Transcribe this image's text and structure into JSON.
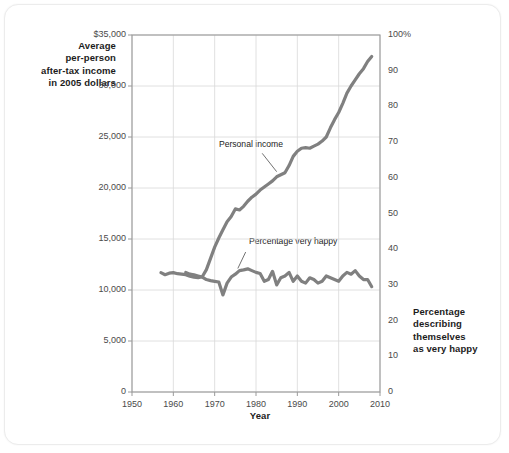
{
  "chart_data": {
    "type": "line",
    "title": "",
    "xlabel": "Year",
    "ylabel": "Average per-person after-tax income in 2005 dollars",
    "y2label": "Percentage describing themselves as very happy",
    "xlim": [
      1950,
      2010
    ],
    "ylim": [
      0,
      35000
    ],
    "y2lim": [
      0,
      100
    ],
    "grid": true,
    "legend_position": "inline-annotations",
    "xticks": [
      1950,
      1960,
      1970,
      1980,
      1990,
      2000,
      2010
    ],
    "xtick_labels": [
      "1950",
      "1960",
      "1970",
      "1980",
      "1990",
      "2000",
      "2010"
    ],
    "yticks": [
      0,
      5000,
      10000,
      15000,
      20000,
      25000,
      30000,
      35000
    ],
    "ytick_labels": [
      "0",
      "5,000",
      "10,000",
      "15,000",
      "20,000",
      "25,000",
      "30,000",
      "$35,000"
    ],
    "y2ticks": [
      0,
      10,
      20,
      30,
      40,
      50,
      60,
      70,
      80,
      90,
      100
    ],
    "y2tick_labels": [
      "0",
      "10",
      "20",
      "30",
      "40",
      "50",
      "60",
      "70",
      "80",
      "90",
      "100%"
    ],
    "line_color": "#808080",
    "grid_color": "#d8d8d8",
    "frame_color": "#9a9a9a",
    "series": [
      {
        "name": "Personal income",
        "axis": "left",
        "annotation": "Personal income",
        "x": [
          1957,
          1958,
          1959,
          1960,
          1961,
          1962,
          1963,
          1964,
          1965,
          1966,
          1967,
          1968,
          1969,
          1970,
          1971,
          1972,
          1973,
          1974,
          1975,
          1976,
          1977,
          1978,
          1979,
          1980,
          1981,
          1982,
          1983,
          1984,
          1985,
          1986,
          1987,
          1988,
          1989,
          1990,
          1991,
          1992,
          1993,
          1994,
          1995,
          1996,
          1997,
          1998,
          1999,
          2000,
          2001,
          2002,
          2003,
          2004,
          2005,
          2006,
          2007,
          2008
        ],
        "values": [
          11700,
          11500,
          11650,
          11700,
          11600,
          11550,
          11500,
          11350,
          11250,
          11200,
          11300,
          12000,
          13100,
          14200,
          15100,
          15900,
          16700,
          17200,
          17950,
          17850,
          18200,
          18700,
          19100,
          19400,
          19800,
          20100,
          20400,
          20700,
          21100,
          21300,
          21500,
          22200,
          23100,
          23600,
          23900,
          23950,
          23900,
          24100,
          24300,
          24600,
          25000,
          25900,
          26700,
          27400,
          28300,
          29300,
          30000,
          30600,
          31200,
          31700,
          32400,
          32900
        ]
      },
      {
        "name": "Percentage very happy",
        "axis": "right",
        "annotation": "Percentage very happy",
        "x": [
          1963,
          1964,
          1965,
          1966,
          1967,
          1968,
          1969,
          1970,
          1971,
          1972,
          1973,
          1974,
          1975,
          1976,
          1977,
          1978,
          1979,
          1980,
          1981,
          1982,
          1983,
          1984,
          1985,
          1986,
          1987,
          1988,
          1989,
          1990,
          1991,
          1992,
          1993,
          1994,
          1995,
          1996,
          1997,
          1998,
          1999,
          2000,
          2001,
          2002,
          2003,
          2004,
          2005,
          2006,
          2007,
          2008
        ],
        "values": [
          33.5,
          33.0,
          32.8,
          32.5,
          32.2,
          31.5,
          31.2,
          31.0,
          30.8,
          27.2,
          30.5,
          32.2,
          33.0,
          34.0,
          34.2,
          34.5,
          34.0,
          33.5,
          33.2,
          31.0,
          31.5,
          33.8,
          30.0,
          32.0,
          32.5,
          33.5,
          31.0,
          32.5,
          31.0,
          30.5,
          32.0,
          31.5,
          30.5,
          31.0,
          32.5,
          32.0,
          31.5,
          31.0,
          32.5,
          33.5,
          33.0,
          34.0,
          32.5,
          31.5,
          31.5,
          29.5
        ]
      }
    ],
    "annotations": [
      {
        "text": "Personal income",
        "x_pos": 1972,
        "y_pos": 24200
      },
      {
        "text": "Percentage very happy",
        "x_pos": 1980,
        "y_pos": 14700
      }
    ]
  },
  "axis_titles": {
    "left": "Average\nper-person\nafter-tax income\nin 2005 dollars",
    "left_lines": [
      "Average",
      "per-person",
      "after-tax income",
      "in 2005 dollars"
    ],
    "right_lines": [
      "Percentage",
      "describing",
      "themselves",
      "as very happy"
    ],
    "bottom": "Year"
  }
}
